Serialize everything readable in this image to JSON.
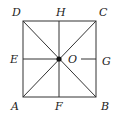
{
  "diagram": {
    "type": "square with diagonals and midlines",
    "stroke_color": "#333333",
    "background": "#ffffff",
    "labels": {
      "D": "D",
      "H": "H",
      "C": "C",
      "E": "E",
      "O": "O",
      "G": "G",
      "A": "A",
      "F": "F",
      "B": "B"
    },
    "points": {
      "A": [
        23,
        97
      ],
      "B": [
        96,
        97
      ],
      "C": [
        96,
        21
      ],
      "D": [
        23,
        21
      ],
      "E": [
        23,
        59
      ],
      "F": [
        59,
        97
      ],
      "G": [
        96,
        59
      ],
      "H": [
        59,
        21
      ],
      "O": [
        59,
        59
      ]
    },
    "segments": [
      "AB",
      "BC",
      "CD",
      "DA",
      "AC",
      "BD",
      "EO",
      "OG",
      "HF"
    ],
    "center_dot": "O"
  }
}
